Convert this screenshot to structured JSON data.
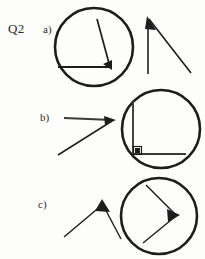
{
  "page": {
    "question_label": "Q2",
    "background_color": "#fdfdfc",
    "ink_color": "#1d1d1d",
    "width": 205,
    "height": 259
  },
  "parts": [
    {
      "label": "a)",
      "label_x": 43,
      "label_y": 22,
      "plain_figure": {
        "name": "angle-acute-vertex-top",
        "description": "acute angle, vertex at top with filled triangle marker, one ray vertical downward, one ray slanting down to the right",
        "vertex": [
          148,
          18
        ],
        "ray_ends": [
          [
            148,
            74
          ],
          [
            191,
            73
          ]
        ],
        "marker": "triangle"
      },
      "circle_figure": {
        "name": "circled-angle-acute",
        "description": "same acute angle drawn inside a circle, vertex at lower right with filled triangle marker, horizontal ray to the left and ray slanting up",
        "circle_center": [
          94,
          47
        ],
        "circle_radius": 39,
        "vertex": [
          110,
          67
        ],
        "ray_ends": [
          [
            58,
            67
          ],
          [
            97,
            19
          ]
        ],
        "marker": "triangle"
      }
    },
    {
      "label": "b)",
      "label_x": 40,
      "label_y": 112,
      "plain_figure": {
        "name": "angle-acute-vertex-right",
        "description": "acute angle, vertex at right with filled triangle marker, horizontal ray to the left and ray slanting down to the left",
        "vertex": [
          112,
          120
        ],
        "ray_ends": [
          [
            64,
            118
          ],
          [
            58,
            155
          ]
        ],
        "marker": "triangle"
      },
      "circle_figure": {
        "name": "circled-angle-right",
        "description": "right angle drawn inside a circle, vertex at lower left with small square right-angle marker, one ray vertical upward and one ray horizontal to the right",
        "circle_center": [
          161,
          129
        ],
        "circle_radius": 39,
        "vertex": [
          133,
          154
        ],
        "ray_ends": [
          [
            133,
            101
          ],
          [
            186,
            154
          ]
        ],
        "marker": "right-angle-square"
      }
    },
    {
      "label": "c)",
      "label_x": 38,
      "label_y": 199,
      "plain_figure": {
        "name": "angle-obtuse-vertex-top",
        "description": "obtuse angle shaped like an inverted V, vertex at top with filled triangle marker, rays slanting down left and down right",
        "vertex": [
          102,
          203
        ],
        "ray_ends": [
          [
            64,
            237
          ],
          [
            121,
            239
          ]
        ],
        "marker": "triangle"
      },
      "circle_figure": {
        "name": "circled-angle-obtuse",
        "description": "obtuse angle drawn inside a circle, vertex at the right pointing like a greater-than sign, rays slanting up-left and down-left",
        "circle_center": [
          159,
          216
        ],
        "circle_radius": 38,
        "vertex": [
          176,
          215
        ],
        "ray_ends": [
          [
            146,
            185
          ],
          [
            143,
            243
          ]
        ],
        "marker": "triangle"
      }
    }
  ]
}
